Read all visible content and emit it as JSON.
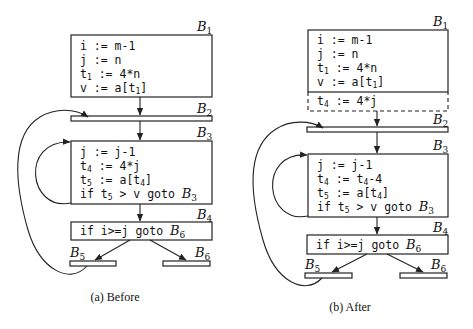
{
  "diagram": {
    "colors": {
      "stroke": "#222222",
      "text": "#111111",
      "background": "#ffffff"
    },
    "before": {
      "caption": "(a) Before",
      "blocks": {
        "B1": {
          "label": "B",
          "sub": "1",
          "lines": [
            {
              "pre": "i := m-1"
            },
            {
              "pre": "j := n"
            },
            {
              "pre": "t",
              "s": "1",
              "post": " := 4*n"
            },
            {
              "pre": "v := a[t",
              "s": "1",
              "post": "]"
            }
          ]
        },
        "B2": {
          "label": "B",
          "sub": "2"
        },
        "B3": {
          "label": "B",
          "sub": "3",
          "lines": [
            {
              "pre": "j := j-1"
            },
            {
              "pre": "t",
              "s": "4",
              "post": " := 4*j"
            },
            {
              "pre": "t",
              "s": "5",
              "post": " := a[t",
              "s2": "4",
              "post2": "]"
            },
            {
              "pre": "if t",
              "s": "5",
              "post": " > v goto ",
              "blabel": "B",
              "bsub": "3"
            }
          ]
        },
        "B4": {
          "label": "B",
          "sub": "4",
          "lines": [
            {
              "pre": "if i>=j goto ",
              "blabel": "B",
              "bsub": "6"
            }
          ]
        },
        "B5": {
          "label": "B",
          "sub": "5"
        },
        "B6": {
          "label": "B",
          "sub": "6"
        }
      }
    },
    "after": {
      "caption": "(b) After",
      "blocks": {
        "B1": {
          "label": "B",
          "sub": "1",
          "lines": [
            {
              "pre": "i := m-1"
            },
            {
              "pre": "j := n"
            },
            {
              "pre": "t",
              "s": "1",
              "post": " := 4*n"
            },
            {
              "pre": "v := a[t",
              "s": "1",
              "post": "]"
            }
          ],
          "inserted": {
            "pre": "t",
            "s": "4",
            "post": " := 4*j"
          }
        },
        "B2": {
          "label": "B",
          "sub": "2"
        },
        "B3": {
          "label": "B",
          "sub": "3",
          "lines": [
            {
              "pre": "j := j-1"
            },
            {
              "pre": "t",
              "s": "4",
              "post": " := t",
              "s2": "4",
              "post2": "-4"
            },
            {
              "pre": "t",
              "s": "5",
              "post": " := a[t",
              "s2": "4",
              "post2": "]"
            },
            {
              "pre": "if t",
              "s": "5",
              "post": " > v goto ",
              "blabel": "B",
              "bsub": "3"
            }
          ]
        },
        "B4": {
          "label": "B",
          "sub": "4",
          "lines": [
            {
              "pre": "if i>=j goto ",
              "blabel": "B",
              "bsub": "6"
            }
          ]
        },
        "B5": {
          "label": "B",
          "sub": "5"
        },
        "B6": {
          "label": "B",
          "sub": "6"
        }
      }
    }
  }
}
